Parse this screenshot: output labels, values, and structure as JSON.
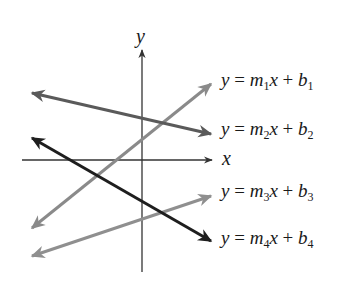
{
  "diagram": {
    "type": "coordinate-plane-lines",
    "axes": {
      "x_label": "x",
      "y_label": "y",
      "color": "#333333"
    },
    "lines": [
      {
        "id": 1,
        "equation": {
          "y": "y",
          "m": "m",
          "m_sub": "1",
          "x": "x",
          "b": "b",
          "b_sub": "1"
        },
        "slope_sign": "positive",
        "color": "#8a8a8a",
        "x1": 32,
        "y1": 228,
        "x2": 211,
        "y2": 84
      },
      {
        "id": 2,
        "equation": {
          "y": "y",
          "m": "m",
          "m_sub": "2",
          "x": "x",
          "b": "b",
          "b_sub": "2"
        },
        "slope_sign": "negative",
        "color": "#5a5a5a",
        "x1": 32,
        "y1": 93,
        "x2": 211,
        "y2": 134
      },
      {
        "id": 3,
        "equation": {
          "y": "y",
          "m": "m",
          "m_sub": "3",
          "x": "x",
          "b": "b",
          "b_sub": "3"
        },
        "slope_sign": "positive",
        "color": "#8f8f8f",
        "x1": 32,
        "y1": 256,
        "x2": 211,
        "y2": 196
      },
      {
        "id": 4,
        "equation": {
          "y": "y",
          "m": "m",
          "m_sub": "4",
          "x": "x",
          "b": "b",
          "b_sub": "4"
        },
        "slope_sign": "negative",
        "color": "#1e1e1e",
        "x1": 32,
        "y1": 138,
        "x2": 211,
        "y2": 241
      }
    ],
    "operators": {
      "equals": " = ",
      "plus": " + "
    }
  }
}
